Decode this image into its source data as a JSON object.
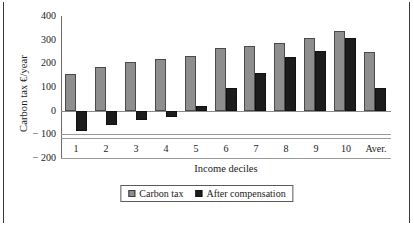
{
  "chart_data": {
    "type": "bar",
    "title": "",
    "xlabel": "Income deciles",
    "ylabel": "Carbon tax €/year",
    "categories": [
      "1",
      "2",
      "3",
      "4",
      "5",
      "6",
      "7",
      "8",
      "9",
      "10",
      "Aver."
    ],
    "series": [
      {
        "name": "Carbon tax",
        "color": "#8e8e8e",
        "values": [
          155,
          185,
          205,
          220,
          232,
          263,
          275,
          288,
          307,
          336,
          250
        ]
      },
      {
        "name": "After compensation",
        "color": "#1c1c1c",
        "values": [
          -88,
          -62,
          -38,
          -27,
          20,
          97,
          160,
          228,
          254,
          305,
          95
        ]
      }
    ],
    "ylim": [
      -200,
      400
    ],
    "yticks": [
      400,
      300,
      200,
      100,
      0,
      -100,
      -200
    ],
    "ytick_labels": [
      "400",
      "300",
      "200",
      "100",
      "0",
      "− 100",
      "− 200"
    ],
    "grid": "horizontal-zero-and-minus100",
    "legend_position": "bottom-center"
  },
  "legend": {
    "entries": [
      {
        "label": "Carbon tax",
        "swatch": "gray-swatch-icon"
      },
      {
        "label": "After compensation",
        "swatch": "black-swatch-icon"
      }
    ]
  }
}
